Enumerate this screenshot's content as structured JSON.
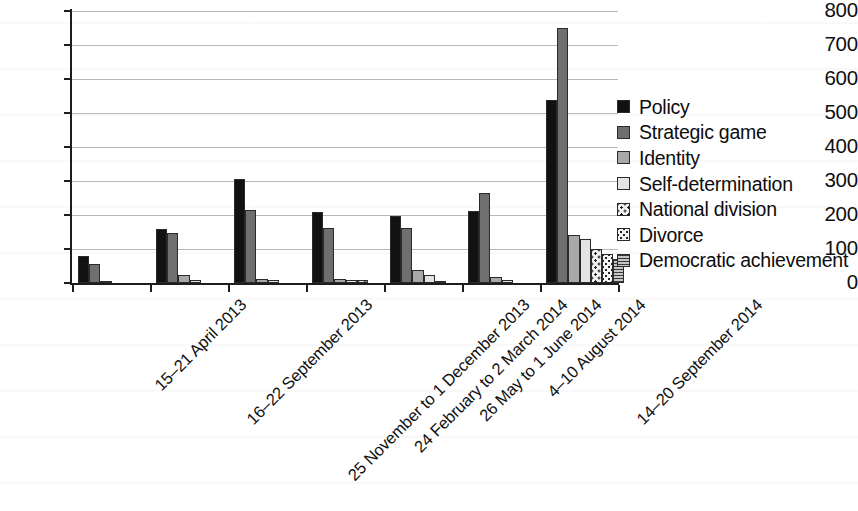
{
  "chart_data": {
    "type": "bar",
    "title": "",
    "subtitle": "",
    "xlabel": "",
    "ylabel": "",
    "ylim": [
      0,
      800
    ],
    "y_ticks": [
      0,
      100,
      200,
      300,
      400,
      500,
      600,
      700,
      800
    ],
    "grid": true,
    "legend_position": "right",
    "orientation": "vertical",
    "grouping": "clustered",
    "categories": [
      "15–21 April 2013",
      "16–22 September 2013",
      "25 November to 1 December 2013",
      "24 February to 2 March 2014",
      "26 May to 1 June 2014",
      "4–10 August 2014",
      "14–20 September 2014"
    ],
    "series": [
      {
        "name": "Policy",
        "color": "#111111",
        "pattern": "solid-black",
        "values": [
          78,
          158,
          307,
          210,
          197,
          213,
          538
        ]
      },
      {
        "name": "Strategic game",
        "color": "#6f6f6f",
        "pattern": "solid-dark-gray",
        "values": [
          55,
          147,
          215,
          163,
          162,
          265,
          750
        ]
      },
      {
        "name": "Identity",
        "color": "#a8a8a8",
        "pattern": "solid-mid-gray",
        "values": [
          5,
          25,
          12,
          12,
          38,
          18,
          140
        ]
      },
      {
        "name": "Self-determination",
        "color": "#e4e4e4",
        "pattern": "solid-light-gray",
        "values": [
          0,
          10,
          10,
          8,
          25,
          8,
          128
        ]
      },
      {
        "name": "National division",
        "color": "#f2f2f2",
        "pattern": "dotted-checker",
        "values": [
          0,
          0,
          0,
          8,
          7,
          0,
          100
        ]
      },
      {
        "name": "Divorce",
        "color": "#f5f5f5",
        "pattern": "fine-dotted",
        "values": [
          0,
          0,
          0,
          0,
          0,
          0,
          85
        ]
      },
      {
        "name": "Democratic achievement",
        "color": "#8d8d8d",
        "pattern": "horizontal-lines",
        "values": [
          0,
          0,
          0,
          0,
          0,
          0,
          70
        ]
      }
    ]
  },
  "axis": {
    "y_tick_labels": [
      "800",
      "700",
      "600",
      "500",
      "400",
      "300",
      "200",
      "100",
      "0"
    ]
  },
  "legend": {
    "entries": [
      "Policy",
      "Strategic game",
      "Identity",
      "Self-determination",
      "National division",
      "Divorce",
      "Democratic achievement"
    ]
  }
}
